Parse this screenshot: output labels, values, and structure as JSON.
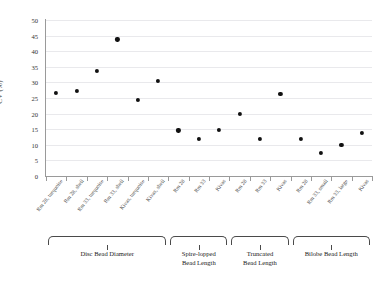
{
  "chart_data": {
    "type": "scatter",
    "title": "",
    "xlabel": "",
    "ylabel": "CV (%)",
    "ylim": [
      0,
      50
    ],
    "ytick_step": 5,
    "yticks": [
      0,
      5,
      10,
      15,
      20,
      25,
      30,
      35,
      40,
      45,
      50
    ],
    "grid": "horizontal",
    "legend": "none",
    "marker": "filled-diamond-black",
    "marker_color": "#111111",
    "categories": [
      "Rm 28, turquoise",
      "Rm 28, shell",
      "Rm 33, turquoise",
      "Rm 33, shell",
      "Kivas, turquoise",
      "Kivas, shell",
      "Rm 28",
      "Rm 33",
      "Kivas",
      "Rm 28",
      "Rm 33",
      "Kivas",
      "Rm 28",
      "Rm 33, small",
      "Rm 33, large",
      "Kivas"
    ],
    "values": [
      26.7,
      27.2,
      33.8,
      43.8,
      24.3,
      30.5,
      14.6,
      11.9,
      14.7,
      19.9,
      11.9,
      26.2,
      11.9,
      7.3,
      9.9,
      13.8
    ],
    "groups": [
      {
        "label": "Disc Bead Diameter",
        "start_index": 0,
        "end_index": 5
      },
      {
        "label": "Spire-lopped\nBead Length",
        "start_index": 6,
        "end_index": 8
      },
      {
        "label": "Truncated\nBead Length",
        "start_index": 9,
        "end_index": 11
      },
      {
        "label": "Bilobe Bead Length",
        "start_index": 12,
        "end_index": 15
      }
    ]
  },
  "axis": {
    "y_title": "CV (%)",
    "y_labels": [
      "50",
      "45",
      "40",
      "35",
      "30",
      "25",
      "20",
      "15",
      "10",
      "5",
      "0"
    ]
  },
  "groups_text": {
    "g0": "Disc Bead Diameter",
    "g1": "Spire-lopped\nBead Length",
    "g2": "Truncated\nBead Length",
    "g3": "Bilobe Bead Length"
  },
  "colors": {
    "marker": "#111111",
    "gridline": "#e9e9ec",
    "axis": "#9a9a9a",
    "text": "#333333",
    "background": "#ffffff"
  }
}
